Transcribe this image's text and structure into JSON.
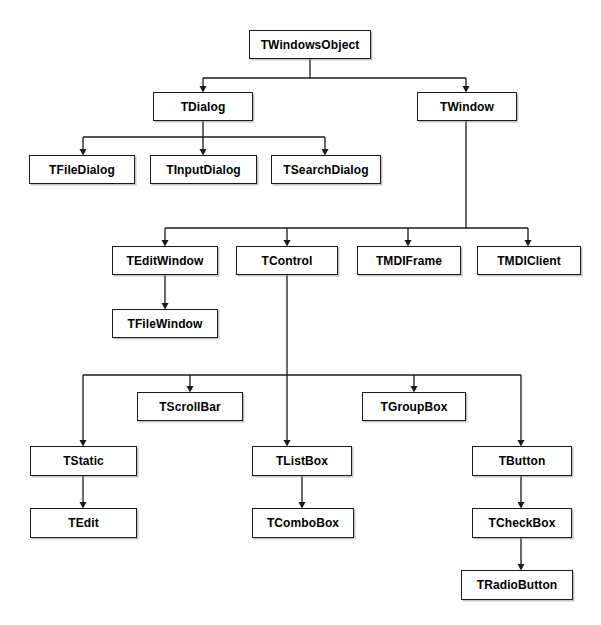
{
  "diagram": {
    "type": "class-hierarchy-tree",
    "background_color": "#ffffff",
    "box_border_color": "#1a1a1a",
    "edge_color": "#1a1a1a",
    "nodes": [
      {
        "id": "twindowsobject",
        "label": "TWindowsObject",
        "x": 249,
        "y": 30,
        "w": 122,
        "h": 29
      },
      {
        "id": "tdialog",
        "label": "TDialog",
        "x": 153,
        "y": 92,
        "w": 100,
        "h": 29
      },
      {
        "id": "twindow",
        "label": "TWindow",
        "x": 417,
        "y": 92,
        "w": 100,
        "h": 29
      },
      {
        "id": "tfiledialog",
        "label": "TFileDialog",
        "x": 29,
        "y": 155,
        "w": 106,
        "h": 29
      },
      {
        "id": "tinputdialog",
        "label": "TInputDialog",
        "x": 150,
        "y": 155,
        "w": 107,
        "h": 29
      },
      {
        "id": "tsearchdialog",
        "label": "TSearchDialog",
        "x": 271,
        "y": 155,
        "w": 110,
        "h": 29
      },
      {
        "id": "teditwindow",
        "label": "TEditWindow",
        "x": 112,
        "y": 246,
        "w": 106,
        "h": 29
      },
      {
        "id": "tcontrol",
        "label": "TControl",
        "x": 236,
        "y": 246,
        "w": 102,
        "h": 29
      },
      {
        "id": "tmdiframe",
        "label": "TMDIFrame",
        "x": 357,
        "y": 246,
        "w": 104,
        "h": 29
      },
      {
        "id": "tmdiclient",
        "label": "TMDIClient",
        "x": 477,
        "y": 246,
        "w": 104,
        "h": 29
      },
      {
        "id": "tfilewindow",
        "label": "TFileWindow",
        "x": 112,
        "y": 309,
        "w": 106,
        "h": 29
      },
      {
        "id": "tscrollbar",
        "label": "TScrollBar",
        "x": 137,
        "y": 392,
        "w": 106,
        "h": 29
      },
      {
        "id": "tgroupbox",
        "label": "TGroupBox",
        "x": 362,
        "y": 392,
        "w": 104,
        "h": 29
      },
      {
        "id": "tstatic",
        "label": "TStatic",
        "x": 30,
        "y": 446,
        "w": 107,
        "h": 30
      },
      {
        "id": "tlistbox",
        "label": "TListBox",
        "x": 252,
        "y": 446,
        "w": 100,
        "h": 30
      },
      {
        "id": "tbutton",
        "label": "TButton",
        "x": 472,
        "y": 446,
        "w": 100,
        "h": 30
      },
      {
        "id": "tedit",
        "label": "TEdit",
        "x": 30,
        "y": 508,
        "w": 107,
        "h": 30
      },
      {
        "id": "tcombobox",
        "label": "TComboBox",
        "x": 252,
        "y": 508,
        "w": 102,
        "h": 30
      },
      {
        "id": "tcheckbox",
        "label": "TCheckBox",
        "x": 472,
        "y": 508,
        "w": 100,
        "h": 30
      },
      {
        "id": "tradiobutton",
        "label": "TRadioButton",
        "x": 461,
        "y": 570,
        "w": 112,
        "h": 30
      }
    ],
    "edges": [
      {
        "from": "twindowsobject",
        "to": "tdialog"
      },
      {
        "from": "twindowsobject",
        "to": "twindow"
      },
      {
        "from": "tdialog",
        "to": "tfiledialog"
      },
      {
        "from": "tdialog",
        "to": "tinputdialog"
      },
      {
        "from": "tdialog",
        "to": "tsearchdialog"
      },
      {
        "from": "twindow",
        "to": "teditwindow"
      },
      {
        "from": "twindow",
        "to": "tcontrol"
      },
      {
        "from": "twindow",
        "to": "tmdiframe"
      },
      {
        "from": "twindow",
        "to": "tmdiclient"
      },
      {
        "from": "teditwindow",
        "to": "tfilewindow"
      },
      {
        "from": "tcontrol",
        "to": "tstatic"
      },
      {
        "from": "tcontrol",
        "to": "tscrollbar"
      },
      {
        "from": "tcontrol",
        "to": "tlistbox"
      },
      {
        "from": "tcontrol",
        "to": "tgroupbox"
      },
      {
        "from": "tcontrol",
        "to": "tbutton"
      },
      {
        "from": "tstatic",
        "to": "tedit"
      },
      {
        "from": "tlistbox",
        "to": "tcombobox"
      },
      {
        "from": "tbutton",
        "to": "tcheckbox"
      },
      {
        "from": "tcheckbox",
        "to": "tradiobutton"
      }
    ]
  }
}
